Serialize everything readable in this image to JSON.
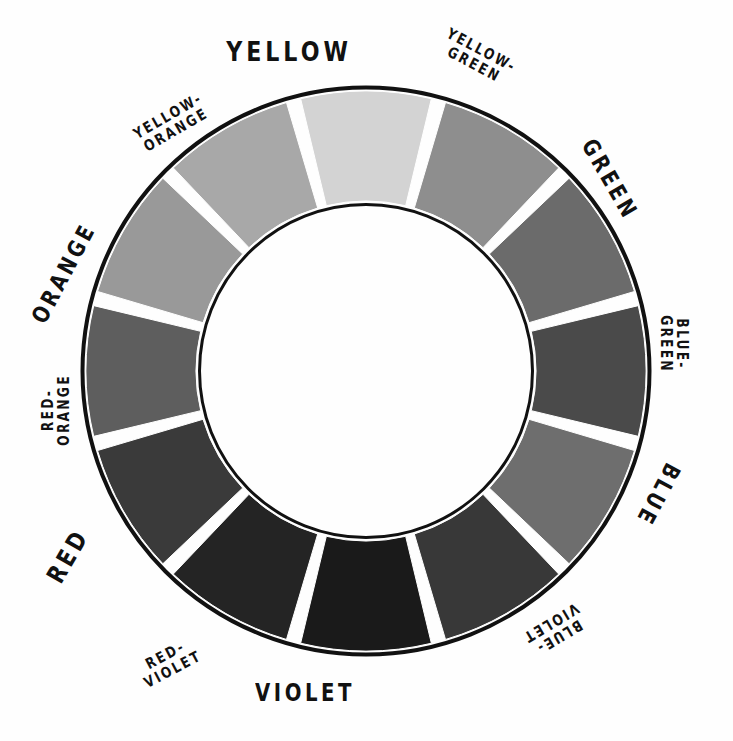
{
  "figure": {
    "type": "twelve-part color wheel diagram",
    "background_color": "#fefefe",
    "outline_color": "#111111",
    "gap_color": "#ffffff",
    "center_x": 366,
    "center_y": 371,
    "outer_radius": 280,
    "inner_radius": 170,
    "segment_count": 12,
    "segment_span_degrees": 30
  },
  "segments": [
    {
      "id": "yellow",
      "label_lines": [
        "YELLOW"
      ],
      "color": "#d3d3d3",
      "start_angle": -15,
      "end_angle": 15,
      "center_angle": 0
    },
    {
      "id": "yellow-green",
      "label_lines": [
        "YELLOW-",
        "GREEN"
      ],
      "color": "#8e8e8e",
      "start_angle": 15,
      "end_angle": 45,
      "center_angle": 30
    },
    {
      "id": "green",
      "label_lines": [
        "GREEN"
      ],
      "color": "#6b6b6b",
      "start_angle": 45,
      "end_angle": 75,
      "center_angle": 60
    },
    {
      "id": "blue-green",
      "label_lines": [
        "BLUE-",
        "GREEN"
      ],
      "color": "#4a4a4a",
      "start_angle": 75,
      "end_angle": 105,
      "center_angle": 90
    },
    {
      "id": "blue",
      "label_lines": [
        "BLUE"
      ],
      "color": "#6e6e6e",
      "start_angle": 105,
      "end_angle": 135,
      "center_angle": 120
    },
    {
      "id": "blue-violet",
      "label_lines": [
        "BLUE-",
        "VIOLET"
      ],
      "color": "#383838",
      "start_angle": 135,
      "end_angle": 165,
      "center_angle": 150
    },
    {
      "id": "violet",
      "label_lines": [
        "VIOLET"
      ],
      "color": "#1a1a1a",
      "start_angle": 165,
      "end_angle": 195,
      "center_angle": 180
    },
    {
      "id": "red-violet",
      "label_lines": [
        "RED-",
        "VIOLET"
      ],
      "color": "#242424",
      "start_angle": 195,
      "end_angle": 225,
      "center_angle": 210
    },
    {
      "id": "red",
      "label_lines": [
        "RED"
      ],
      "color": "#3a3a3a",
      "start_angle": 225,
      "end_angle": 255,
      "center_angle": 240
    },
    {
      "id": "red-orange",
      "label_lines": [
        "RED-",
        "ORANGE"
      ],
      "color": "#5e5e5e",
      "start_angle": 255,
      "end_angle": 285,
      "center_angle": 270
    },
    {
      "id": "orange",
      "label_lines": [
        "ORANGE"
      ],
      "color": "#999999",
      "start_angle": 285,
      "end_angle": 315,
      "center_angle": 300
    },
    {
      "id": "yellow-orange",
      "label_lines": [
        "YELLOW-",
        "ORANGE"
      ],
      "color": "#a8a8a8",
      "start_angle": 315,
      "end_angle": 345,
      "center_angle": 330
    }
  ],
  "label_layout": [
    {
      "id": "yellow",
      "x": 366,
      "y": 52,
      "rotate": 0,
      "font_size": 27
    },
    {
      "id": "yellow-green",
      "x": 519,
      "y": 80,
      "rotate": 28,
      "font_size": 15
    },
    {
      "id": "green",
      "x": 637,
      "y": 226,
      "rotate": 60,
      "font_size": 23
    },
    {
      "id": "blue-green",
      "x": 673,
      "y": 379,
      "rotate": 90,
      "font_size": 15
    },
    {
      "id": "blue",
      "x": 639,
      "y": 531,
      "rotate": 118,
      "font_size": 23
    },
    {
      "id": "blue-violet",
      "x": 522,
      "y": 649,
      "rotate": 149,
      "font_size": 15
    },
    {
      "id": "violet",
      "x": 366,
      "y": 694,
      "rotate": 0,
      "font_size": 24
    },
    {
      "id": "red-violet",
      "x": 203,
      "y": 645,
      "rotate": -28,
      "font_size": 15
    },
    {
      "id": "red",
      "x": 86,
      "y": 526,
      "rotate": -60,
      "font_size": 25
    },
    {
      "id": "red-orange",
      "x": 57,
      "y": 366,
      "rotate": -90,
      "font_size": 15
    },
    {
      "id": "orange",
      "x": 95,
      "y": 214,
      "rotate": -62,
      "font_size": 23
    },
    {
      "id": "yellow-orange",
      "x": 213,
      "y": 100,
      "rotate": -30,
      "font_size": 15
    }
  ]
}
